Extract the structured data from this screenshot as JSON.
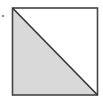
{
  "diagram": {
    "type": "square-divided-by-diagonal",
    "square": {
      "x": 12,
      "y": 8,
      "size": 86
    },
    "shaded_region": "lower-left triangle",
    "colors": {
      "background": "#ffffff",
      "stroke": "#444444",
      "shade": "#d9d9d9",
      "dot": "#555555"
    },
    "marker_dot": {
      "x": 3,
      "y": 16
    }
  }
}
